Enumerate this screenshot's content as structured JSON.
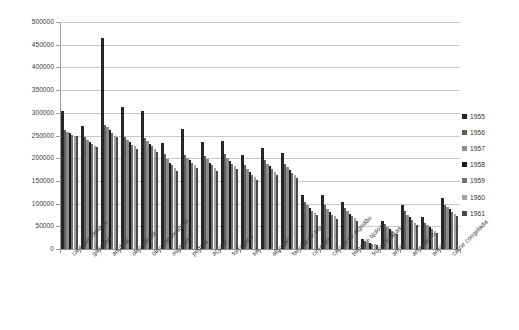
{
  "chart_data": {
    "type": "bar",
    "title": "",
    "subtitle": "",
    "xlabel": "",
    "ylabel": "",
    "ylim": [
      0,
      500000
    ],
    "ytick_step": 50000,
    "yticks": [
      "0",
      "50000",
      "100000",
      "150000",
      "200000",
      "250000",
      "300000",
      "350000",
      "400000",
      "450000",
      "500000"
    ],
    "grid": true,
    "legend_position": "right",
    "categories": [
      "café beneficiado",
      "gasolina",
      "adubos",
      "óleo diesel",
      "óleo combustível",
      "madeira",
      "pedras",
      "açúcar",
      "forragens",
      "sal",
      "algodão",
      "farinha de trigo",
      "cimento",
      "caroço de algodão",
      "telhas e tijolos",
      "frutas frescas",
      "arroz",
      "amendoim",
      "areia",
      "carne congelada"
    ],
    "series": [
      {
        "name": "1955",
        "color": "#262626",
        "values": [
          303000,
          271000,
          465000,
          312000,
          305000,
          233000,
          265000,
          235000,
          237000,
          207000,
          222000,
          212000,
          120000,
          118000,
          104000,
          23000,
          62000,
          96000,
          70000,
          112000
        ]
      },
      {
        "name": "1956",
        "color": "#5f5f5f",
        "values": [
          262000,
          246000,
          274000,
          247000,
          244000,
          210000,
          206000,
          204000,
          210000,
          184000,
          196000,
          188000,
          104000,
          96000,
          90000,
          18000,
          54000,
          83000,
          58000,
          98000
        ]
      },
      {
        "name": "1957",
        "color": "#8c8c8c",
        "values": [
          258000,
          240000,
          268000,
          240000,
          238000,
          198000,
          200000,
          198000,
          200000,
          176000,
          188000,
          180000,
          96000,
          88000,
          84000,
          15000,
          48000,
          76000,
          52000,
          92000
        ]
      },
      {
        "name": "1958",
        "color": "#1a1a1a",
        "values": [
          255000,
          236000,
          262000,
          236000,
          232000,
          190000,
          196000,
          190000,
          194000,
          170000,
          182000,
          174000,
          90000,
          82000,
          78000,
          13000,
          44000,
          70000,
          48000,
          88000
        ]
      },
      {
        "name": "1959",
        "color": "#707070",
        "values": [
          252000,
          232000,
          256000,
          230000,
          226000,
          184000,
          190000,
          184000,
          188000,
          164000,
          176000,
          168000,
          84000,
          76000,
          72000,
          11000,
          40000,
          64000,
          44000,
          82000
        ]
      },
      {
        "name": "1960",
        "color": "#a3a3a3",
        "values": [
          250000,
          228000,
          250000,
          226000,
          220000,
          178000,
          184000,
          178000,
          182000,
          158000,
          170000,
          162000,
          80000,
          72000,
          68000,
          10000,
          36000,
          58000,
          40000,
          78000
        ]
      },
      {
        "name": "1961",
        "color": "#4a4a4a",
        "values": [
          248000,
          224000,
          246000,
          220000,
          214000,
          172000,
          178000,
          172000,
          176000,
          152000,
          164000,
          156000,
          74000,
          66000,
          62000,
          9000,
          32000,
          52000,
          36000,
          72000
        ]
      }
    ],
    "cluster_peaks": [
      303000,
      312000,
      465000,
      265000,
      247000,
      237000,
      222000,
      212000,
      120000,
      118000,
      112000,
      104000,
      96000,
      70000,
      62000,
      23000,
      112000,
      96000,
      70000,
      62000
    ]
  },
  "legend": {
    "items": [
      {
        "label": "1955"
      },
      {
        "label": "1956"
      },
      {
        "label": "1957"
      },
      {
        "label": "1958"
      },
      {
        "label": "1959"
      },
      {
        "label": "1960"
      },
      {
        "label": "1961"
      }
    ]
  },
  "colors": {
    "grid": "#c9c9c9",
    "axis": "#9a9a9a",
    "text": "#3a3a3a",
    "background": "#ffffff"
  }
}
